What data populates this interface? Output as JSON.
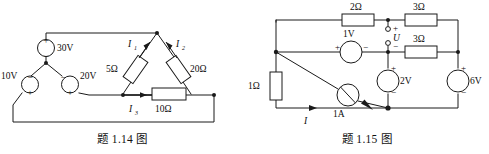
{
  "figures": [
    {
      "id": "fig-1-14",
      "caption": "题 1.14 图",
      "sources": [
        {
          "name": "source-30v",
          "label": "30V",
          "type": "voltage",
          "plus": "+",
          "minus": "−"
        },
        {
          "name": "source-10v",
          "label": "10V",
          "type": "voltage",
          "plus": "+",
          "minus": "−"
        },
        {
          "name": "source-20v",
          "label": "20V",
          "type": "voltage",
          "plus": "+",
          "minus": "−"
        }
      ],
      "resistors": [
        {
          "name": "resistor-5ohm",
          "label": "5Ω"
        },
        {
          "name": "resistor-20ohm",
          "label": "20Ω"
        },
        {
          "name": "resistor-10ohm",
          "label": "10Ω"
        }
      ],
      "currents": [
        {
          "name": "current-i1",
          "symbol": "I",
          "subscript": "1"
        },
        {
          "name": "current-i2",
          "symbol": "I",
          "subscript": "2"
        },
        {
          "name": "current-i3",
          "symbol": "I",
          "subscript": "3"
        }
      ]
    },
    {
      "id": "fig-1-15",
      "caption": "题 1.15 图",
      "sources": [
        {
          "name": "source-1v",
          "label": "1V",
          "type": "voltage",
          "plus": "+",
          "minus": "−"
        },
        {
          "name": "source-1a",
          "label": "1A",
          "type": "current"
        },
        {
          "name": "source-2v",
          "label": "2V",
          "type": "voltage",
          "plus": "+",
          "minus": "−"
        },
        {
          "name": "source-6v",
          "label": "6V",
          "type": "voltage",
          "plus": "+",
          "minus": "−"
        }
      ],
      "resistors": [
        {
          "name": "resistor-2ohm",
          "label": "2Ω"
        },
        {
          "name": "resistor-3ohm-top",
          "label": "3Ω"
        },
        {
          "name": "resistor-3ohm-middle",
          "label": "3Ω"
        },
        {
          "name": "resistor-1ohm",
          "label": "1Ω"
        }
      ],
      "terminal_voltage": {
        "name": "voltage-u",
        "label": "U",
        "plus": "+",
        "minus": "−"
      },
      "currents": [
        {
          "name": "current-i",
          "symbol": "I",
          "subscript": ""
        }
      ]
    }
  ],
  "colors": {
    "line": "#1a1a1a",
    "text": "#0d0d0d",
    "background": "#ffffff"
  }
}
